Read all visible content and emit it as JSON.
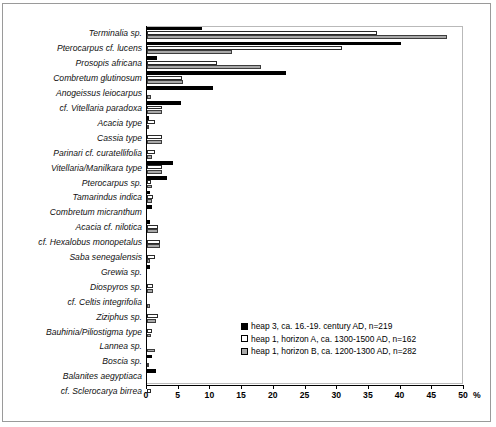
{
  "chart_data": {
    "type": "bar",
    "orientation": "horizontal",
    "title": "",
    "xlabel": "%",
    "ylabel": "",
    "xlim": [
      0,
      50
    ],
    "xticks": [
      0,
      5,
      10,
      15,
      20,
      25,
      30,
      35,
      40,
      45,
      50
    ],
    "grid": false,
    "legend_position": "inside-lower-right",
    "categories": [
      "Terminalia sp.",
      "Pterocarpus cf. lucens",
      "Prosopis africana",
      "Combretum glutinosum",
      "Anogeissus leiocarpus",
      "cf. Vitellaria paradoxa",
      "Acacia type",
      "Cassia type",
      "Parinari cf. curatellifolia",
      "Vitellaria/Manilkara type",
      "Pterocarpus sp.",
      "Tamarindus indica",
      "Combretum micranthum",
      "Acacia cf. nilotica",
      "cf. Hexalobus monopetalus",
      "Saba senegalensis",
      "Grewia sp.",
      "Diospyros sp.",
      "cf. Celtis integrifolia",
      "Ziziphus sp.",
      "Bauhinia/Piliostigma type",
      "Lannea sp.",
      "Boscia sp.",
      "Balanites aegyptiaca",
      "cf. Sclerocarya birrea"
    ],
    "series": [
      {
        "name": "heap 3, ca. 16.-19. century AD, n=219",
        "color": "#000000",
        "values": [
          8.6,
          40.0,
          1.6,
          21.9,
          10.4,
          5.4,
          0.3,
          0.0,
          0.0,
          4.1,
          3.2,
          0.4,
          0.8,
          0.4,
          0.0,
          0.0,
          0.4,
          0.0,
          0.0,
          0.0,
          0.0,
          0.0,
          0.8,
          1.4,
          0.0
        ]
      },
      {
        "name": "heap 1, horizon A, ca. 1300-1500 AD, n=162",
        "color": "#ffffff",
        "values": [
          36.3,
          30.8,
          11.0,
          5.5,
          0.0,
          2.4,
          1.2,
          2.4,
          1.2,
          2.4,
          0.6,
          1.0,
          0.0,
          1.8,
          2.0,
          1.2,
          0.0,
          0.9,
          0.0,
          1.8,
          0.8,
          0.0,
          0.0,
          0.0,
          0.7
        ]
      },
      {
        "name": "heap 1, horizon B, ca. 1200-1300 AD, n=282",
        "color": "#a8a8a8",
        "values": [
          47.3,
          13.4,
          18.0,
          5.6,
          0.6,
          2.4,
          0.3,
          2.3,
          0.8,
          2.3,
          0.8,
          0.8,
          0.0,
          1.8,
          2.1,
          0.4,
          0.0,
          0.9,
          0.5,
          1.4,
          0.6,
          1.3,
          0.3,
          0.0,
          0.0
        ]
      }
    ],
    "axis_unit_label": "%"
  },
  "legend": {
    "items": [
      {
        "label": "heap 3, ca. 16.-19. century AD, n=219",
        "swatch": "black-square-icon"
      },
      {
        "label": "heap 1, horizon A, ca. 1300-1500 AD, n=162",
        "swatch": "white-square-icon"
      },
      {
        "label": "heap 1, horizon B, ca. 1200-1300 AD, n=282",
        "swatch": "gray-square-icon"
      }
    ]
  }
}
